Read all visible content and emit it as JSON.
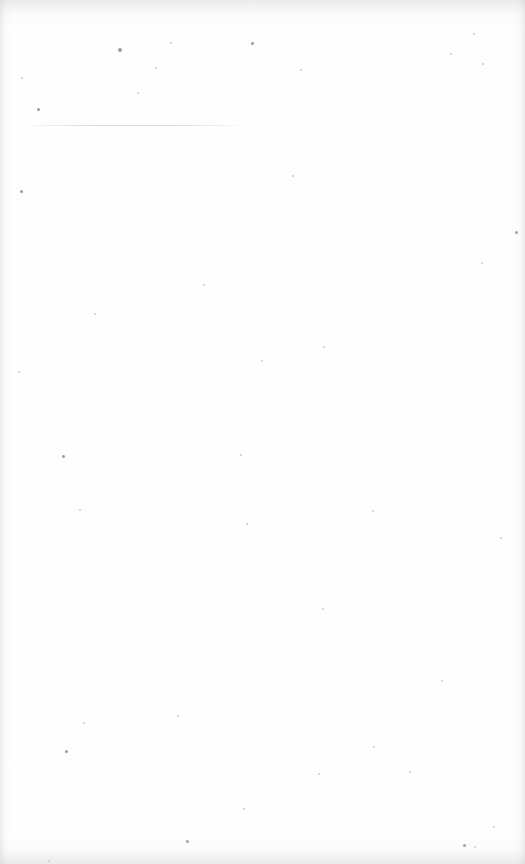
{
  "page": {
    "type": "blank-scanned-page",
    "background_color": "#fefefe",
    "edge_shadow_color": "#c8c8c8",
    "text_content": []
  },
  "rule": {
    "x": 30,
    "y": 125,
    "width": 210,
    "color": "#cdcdcd"
  },
  "specks": [
    [
      118,
      48,
      2
    ],
    [
      251,
      42,
      1.5
    ],
    [
      155,
      67,
      1
    ],
    [
      37,
      108,
      1.5
    ],
    [
      21,
      77,
      1
    ],
    [
      450,
      53,
      1
    ],
    [
      473,
      33,
      1
    ],
    [
      300,
      69,
      1
    ],
    [
      170,
      42,
      1
    ],
    [
      137,
      92,
      1
    ],
    [
      20,
      190,
      1.5
    ],
    [
      515,
      231,
      1.5
    ],
    [
      292,
      175,
      1
    ],
    [
      203,
      284,
      1
    ],
    [
      481,
      262,
      1
    ],
    [
      482,
      63,
      1
    ],
    [
      94,
      313,
      1
    ],
    [
      261,
      360,
      1
    ],
    [
      323,
      346,
      1
    ],
    [
      18,
      371,
      1
    ],
    [
      62,
      455,
      1.5
    ],
    [
      240,
      454,
      1
    ],
    [
      246,
      523,
      1
    ],
    [
      79,
      509,
      1
    ],
    [
      372,
      510,
      1
    ],
    [
      500,
      537,
      1
    ],
    [
      322,
      608,
      1
    ],
    [
      441,
      680,
      1
    ],
    [
      65,
      750,
      1.5
    ],
    [
      177,
      715,
      1
    ],
    [
      83,
      722,
      1
    ],
    [
      409,
      771,
      1
    ],
    [
      373,
      746,
      1
    ],
    [
      318,
      773,
      1
    ],
    [
      186,
      840,
      1.5
    ],
    [
      463,
      844,
      1.5
    ],
    [
      474,
      846,
      1
    ],
    [
      48,
      860,
      1
    ],
    [
      243,
      808,
      1
    ],
    [
      493,
      826,
      1
    ]
  ]
}
